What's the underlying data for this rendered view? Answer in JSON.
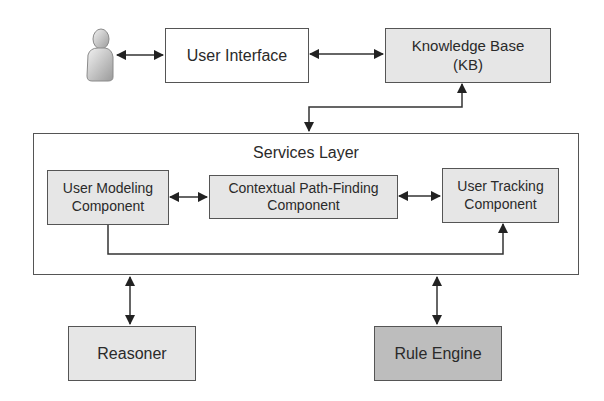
{
  "diagram": {
    "actor": {
      "icon": "user-person-icon"
    },
    "user_interface": {
      "label": "User Interface"
    },
    "knowledge_base": {
      "line1": "Knowledge Base",
      "line2": "(KB)"
    },
    "services_layer": {
      "title": "Services Layer",
      "components": [
        {
          "line1": "User Modeling",
          "line2": "Component"
        },
        {
          "line1": "Contextual Path-Finding",
          "line2": "Component"
        },
        {
          "line1": "User Tracking",
          "line2": "Component"
        }
      ]
    },
    "reasoner": {
      "label": "Reasoner"
    },
    "rule_engine": {
      "label": "Rule Engine"
    },
    "connections": [
      {
        "from": "User",
        "to": "User Interface",
        "type": "bidirectional"
      },
      {
        "from": "User Interface",
        "to": "Knowledge Base (KB)",
        "type": "bidirectional"
      },
      {
        "from": "Knowledge Base (KB)",
        "to": "Services Layer",
        "type": "bidirectional"
      },
      {
        "from": "User Modeling Component",
        "to": "Contextual Path-Finding Component",
        "type": "bidirectional"
      },
      {
        "from": "Contextual Path-Finding Component",
        "to": "User Tracking Component",
        "type": "bidirectional"
      },
      {
        "from": "User Modeling Component",
        "to": "User Tracking Component",
        "type": "directed"
      },
      {
        "from": "Services Layer",
        "to": "Reasoner",
        "type": "bidirectional"
      },
      {
        "from": "Services Layer",
        "to": "Rule Engine",
        "type": "bidirectional"
      }
    ]
  }
}
